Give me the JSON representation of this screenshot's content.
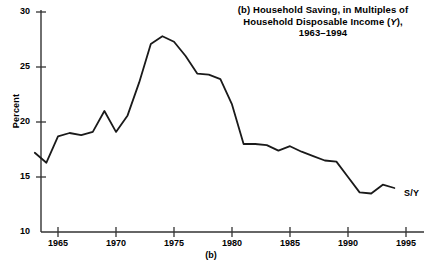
{
  "figure": {
    "title_line1": "(b)  Household Saving, in Multiples of",
    "title_line2_pre": "Household Disposable Income (",
    "title_line2_ital": "Y",
    "title_line2_post": "),",
    "title_line3": "1963–1994",
    "panel_caption": "(b)",
    "series_label": "S/Y",
    "line_color": "#1a1a1a",
    "axis_color": "#333333",
    "background": "#ffffff"
  },
  "chart_data": {
    "type": "line",
    "title": "(b) Household Saving, in Multiples of Household Disposable Income (Y), 1963–1994",
    "xlabel": "(b)",
    "ylabel": "Percent",
    "xlim": [
      1963,
      1996
    ],
    "ylim": [
      10,
      30
    ],
    "xticks": [
      1965,
      1970,
      1975,
      1980,
      1985,
      1990,
      1995
    ],
    "yticks": [
      10,
      15,
      20,
      25,
      30
    ],
    "grid": false,
    "legend": "none",
    "annotations": [
      {
        "text": "S/Y",
        "x": 1995,
        "y": 13.9
      }
    ],
    "series": [
      {
        "name": "S/Y",
        "x": [
          1963,
          1964,
          1965,
          1966,
          1967,
          1968,
          1969,
          1970,
          1971,
          1972,
          1973,
          1974,
          1975,
          1976,
          1977,
          1978,
          1979,
          1980,
          1981,
          1982,
          1983,
          1984,
          1985,
          1986,
          1987,
          1988,
          1989,
          1990,
          1991,
          1992,
          1993,
          1994
        ],
        "values": [
          17.2,
          16.3,
          18.7,
          19.0,
          18.8,
          19.1,
          21.0,
          19.1,
          20.6,
          23.6,
          27.1,
          27.8,
          27.3,
          26.0,
          24.4,
          24.3,
          23.9,
          21.6,
          18.0,
          18.0,
          17.9,
          17.4,
          17.8,
          17.3,
          16.9,
          16.5,
          16.4,
          15.0,
          13.6,
          13.5,
          14.3,
          14.0
        ]
      }
    ]
  },
  "axis": {
    "y_tick_labels": [
      "30",
      "25",
      "20",
      "15",
      "10"
    ],
    "x_tick_labels": [
      "1965",
      "1970",
      "1975",
      "1980",
      "1985",
      "1990",
      "1995"
    ],
    "y_axis_title": "Percent"
  }
}
